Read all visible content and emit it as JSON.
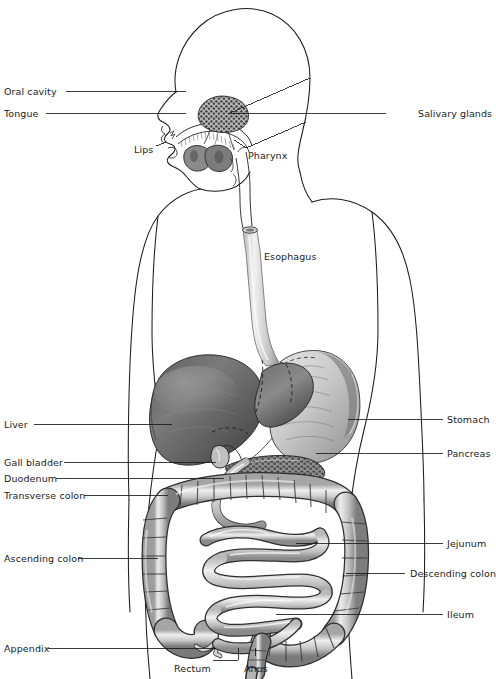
{
  "figure": {
    "type": "anatomical-diagram",
    "view": "sagittal-anterior torso with head in profile",
    "style": "grayscale pencil / halftone medical illustration on white",
    "colors": {
      "background": "#ffffff",
      "outline": "#1a1a1a",
      "leader_line": "#1a1a1a",
      "label_text": "#222222",
      "organ_dark": "#4a4a4a",
      "organ_mid": "#8d8d8d",
      "organ_light": "#d8d8d8"
    }
  },
  "labels": {
    "left": [
      {
        "id": "oral-cavity",
        "text": "Oral cavity",
        "x": 4,
        "y": 86,
        "line_from_x": 66,
        "line_from_y": 91,
        "line_to_x": 186,
        "line_to_y": 91
      },
      {
        "id": "tongue",
        "text": "Tongue",
        "x": 4,
        "y": 108,
        "line_from_x": 46,
        "line_from_y": 113,
        "line_to_x": 186,
        "line_to_y": 113
      },
      {
        "id": "lips",
        "text": "Lips",
        "x": 134,
        "y": 144,
        "line_from_x": 0,
        "line_from_y": 0,
        "line_to_x": 0,
        "line_to_y": 0
      },
      {
        "id": "liver",
        "text": "Liver",
        "x": 4,
        "y": 419,
        "line_from_x": 34,
        "line_from_y": 424,
        "line_to_x": 172,
        "line_to_y": 424
      },
      {
        "id": "gall-bladder",
        "text": "Gall bladder",
        "x": 4,
        "y": 457,
        "line_from_x": 64,
        "line_from_y": 462,
        "line_to_x": 216,
        "line_to_y": 462
      },
      {
        "id": "duodenum",
        "text": "Duodenum",
        "x": 4,
        "y": 473,
        "line_from_x": 56,
        "line_from_y": 478,
        "line_to_x": 224,
        "line_to_y": 478
      },
      {
        "id": "transverse-colon",
        "text": "Transverse colon",
        "x": 4,
        "y": 490,
        "line_from_x": 84,
        "line_from_y": 495,
        "line_to_x": 168,
        "line_to_y": 495
      },
      {
        "id": "ascending-colon",
        "text": "Ascending colon",
        "x": 4,
        "y": 553,
        "line_from_x": 78,
        "line_from_y": 558,
        "line_to_x": 158,
        "line_to_y": 558
      },
      {
        "id": "appendix",
        "text": "Appendix",
        "x": 4,
        "y": 643,
        "line_from_x": 48,
        "line_from_y": 648,
        "line_to_x": 216,
        "line_to_y": 648
      }
    ],
    "right": [
      {
        "id": "salivary-glands",
        "text": "Salivary glands",
        "x": 418,
        "y": 108,
        "line_from_x": 386,
        "line_from_y": 113,
        "line_to_x": 230,
        "line_to_y": 113
      },
      {
        "id": "pharynx",
        "text": "Pharynx",
        "x": 248,
        "y": 150,
        "line_from_x": 0,
        "line_from_y": 0,
        "line_to_x": 0,
        "line_to_y": 0
      },
      {
        "id": "esophagus",
        "text": "Esophagus",
        "x": 264,
        "y": 251,
        "line_from_x": 0,
        "line_from_y": 0,
        "line_to_x": 0,
        "line_to_y": 0
      },
      {
        "id": "stomach",
        "text": "Stomach",
        "x": 447,
        "y": 414,
        "line_from_x": 443,
        "line_from_y": 419,
        "line_to_x": 348,
        "line_to_y": 419
      },
      {
        "id": "pancreas",
        "text": "Pancreas",
        "x": 447,
        "y": 448,
        "line_from_x": 443,
        "line_from_y": 453,
        "line_to_x": 316,
        "line_to_y": 453
      },
      {
        "id": "jejunum",
        "text": "Jejunum",
        "x": 447,
        "y": 538,
        "line_from_x": 443,
        "line_from_y": 543,
        "line_to_x": 296,
        "line_to_y": 543
      },
      {
        "id": "descending-colon",
        "text": "Descending colon",
        "x": 410,
        "y": 568,
        "line_from_x": 405,
        "line_from_y": 573,
        "line_to_x": 346,
        "line_to_y": 573
      },
      {
        "id": "ileum",
        "text": "Ileum",
        "x": 447,
        "y": 609,
        "line_from_x": 443,
        "line_from_y": 614,
        "line_to_x": 276,
        "line_to_y": 614
      }
    ],
    "bottom": [
      {
        "id": "rectum",
        "text": "Rectum",
        "x": 174,
        "y": 663
      },
      {
        "id": "anus",
        "text": "Anus",
        "x": 244,
        "y": 663
      }
    ]
  },
  "organs": [
    {
      "id": "oral-cavity",
      "name": "Oral cavity"
    },
    {
      "id": "tongue",
      "name": "Tongue"
    },
    {
      "id": "lips",
      "name": "Lips"
    },
    {
      "id": "salivary-glands",
      "name": "Salivary glands"
    },
    {
      "id": "pharynx",
      "name": "Pharynx"
    },
    {
      "id": "esophagus",
      "name": "Esophagus"
    },
    {
      "id": "stomach",
      "name": "Stomach"
    },
    {
      "id": "liver",
      "name": "Liver"
    },
    {
      "id": "gall-bladder",
      "name": "Gall bladder"
    },
    {
      "id": "pancreas",
      "name": "Pancreas"
    },
    {
      "id": "duodenum",
      "name": "Duodenum"
    },
    {
      "id": "jejunum",
      "name": "Jejunum"
    },
    {
      "id": "ileum",
      "name": "Ileum"
    },
    {
      "id": "ascending-colon",
      "name": "Ascending colon"
    },
    {
      "id": "transverse-colon",
      "name": "Transverse colon"
    },
    {
      "id": "descending-colon",
      "name": "Descending colon"
    },
    {
      "id": "appendix",
      "name": "Appendix"
    },
    {
      "id": "rectum",
      "name": "Rectum"
    },
    {
      "id": "anus",
      "name": "Anus"
    }
  ]
}
